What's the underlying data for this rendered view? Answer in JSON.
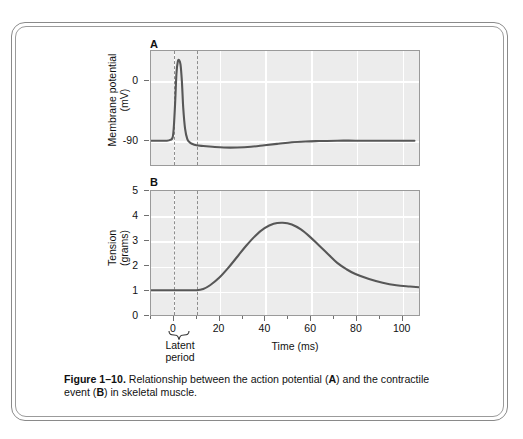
{
  "figure": {
    "caption_label": "Figure 1–10.",
    "caption_text_1": " Relationship between the action potential (",
    "caption_em_a": "A",
    "caption_text_2": ")",
    "caption_text_3": "and the contractile event (",
    "caption_em_b": "B",
    "caption_text_4": ") in skeletal muscle.",
    "latent_period_line1": "Latent",
    "latent_period_line2": "period",
    "brace_icon": "curly-brace-icon"
  },
  "chart_data": [
    {
      "type": "line",
      "panel": "A",
      "title": "A",
      "xlabel": "",
      "ylabel_line1": "Membrane potential",
      "ylabel_line2": "(mV)",
      "ylim": [
        -120,
        30
      ],
      "xlim": [
        -10,
        108
      ],
      "yticks": [
        0,
        -90
      ],
      "ytick_labels": [
        "0",
        "-90"
      ],
      "xticks": [
        0,
        20,
        40,
        60,
        80,
        100
      ],
      "xtick_labels": [
        "0",
        "20",
        "40",
        "60",
        "80",
        "100"
      ],
      "grid": true,
      "markers": [
        {
          "name": "latent-start",
          "x": 0,
          "style": "dashed"
        },
        {
          "name": "latent-end",
          "x": 10,
          "style": "dashed"
        }
      ],
      "x": [
        -10,
        -6,
        -3,
        -1.5,
        -0.5,
        0,
        0.6,
        1.2,
        1.8,
        2.4,
        3.0,
        3.6,
        4.2,
        5.0,
        6.0,
        7.0,
        8.0,
        10,
        13,
        17,
        22,
        28,
        34,
        40,
        46,
        52,
        58,
        64,
        72,
        80,
        90,
        100,
        106
      ],
      "y": [
        -88,
        -88,
        -88,
        -87,
        -84,
        -72,
        -40,
        0,
        16,
        18,
        12,
        -10,
        -45,
        -72,
        -86,
        -90,
        -92,
        -94,
        -95,
        -96,
        -97,
        -97,
        -96,
        -94,
        -92,
        -90,
        -89,
        -88.5,
        -88,
        -88,
        -88,
        -88,
        -88
      ],
      "series_name": "Action potential"
    },
    {
      "type": "line",
      "panel": "B",
      "title": "B",
      "xlabel": "Time (ms)",
      "ylabel_line1": "Tension",
      "ylabel_line2": "(grams)",
      "ylim": [
        0,
        5
      ],
      "xlim": [
        -10,
        108
      ],
      "yticks": [
        0,
        1,
        2,
        3,
        4,
        5
      ],
      "ytick_labels": [
        "0",
        "1",
        "2",
        "3",
        "4",
        "5"
      ],
      "xticks": [
        0,
        20,
        40,
        60,
        80,
        100
      ],
      "xtick_labels": [
        "0",
        "20",
        "40",
        "60",
        "80",
        "100"
      ],
      "grid": true,
      "markers": [
        {
          "name": "latent-start",
          "x": 0,
          "style": "dashed"
        },
        {
          "name": "latent-end",
          "x": 10,
          "style": "dashed"
        }
      ],
      "x": [
        -10,
        -5,
        0,
        5,
        10,
        13,
        16,
        20,
        24,
        28,
        32,
        36,
        40,
        44,
        48,
        52,
        56,
        60,
        64,
        68,
        72,
        76,
        80,
        86,
        92,
        98,
        104,
        108
      ],
      "y": [
        1.0,
        1.0,
        1.0,
        1.0,
        1.0,
        1.05,
        1.2,
        1.5,
        1.9,
        2.35,
        2.8,
        3.2,
        3.5,
        3.68,
        3.72,
        3.65,
        3.45,
        3.15,
        2.8,
        2.45,
        2.1,
        1.85,
        1.65,
        1.45,
        1.3,
        1.2,
        1.15,
        1.12
      ],
      "series_name": "Tension"
    }
  ],
  "colors": {
    "plot_background": "#ececec",
    "gridline": "#ffffff",
    "curve": "#575757",
    "axis": "#9a9a9a",
    "dashed_marker": "#8d8d8d",
    "frame": "#8a8a8a"
  }
}
